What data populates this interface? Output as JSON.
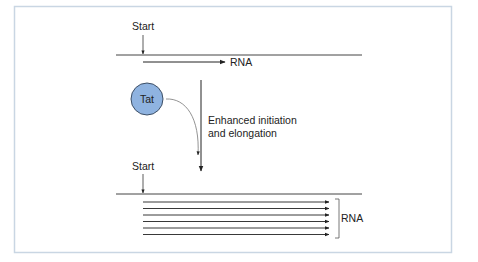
{
  "figure": {
    "colors": {
      "frame": "#c9d6e3",
      "line": "#333333",
      "tat_fill": "#8fb3e0",
      "tat_stroke": "#3d4f66",
      "curve": "#777777"
    },
    "top_panel": {
      "start_label": "Start",
      "rna_label": "RNA"
    },
    "tat": {
      "label": "Tat"
    },
    "effect": {
      "line1": "Enhanced initiation",
      "line2": "and elongation"
    },
    "bottom_panel": {
      "start_label": "Start",
      "rna_label": "RNA",
      "transcript_count": 6
    }
  }
}
